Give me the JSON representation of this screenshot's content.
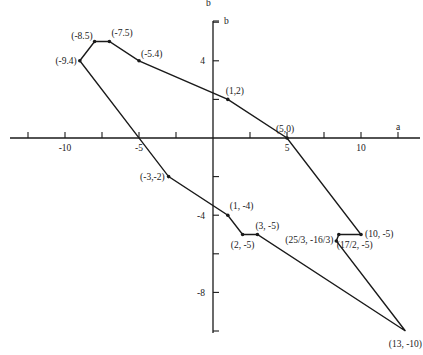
{
  "chart_data": {
    "type": "line",
    "title": "",
    "caption_fragment": "b",
    "xlabel": "a",
    "ylabel": "b",
    "x_ticks": [
      -10,
      -5,
      5,
      10
    ],
    "y_ticks": [
      4,
      -4,
      -8
    ],
    "xlim": [
      -13,
      13.5
    ],
    "ylim": [
      -10,
      6
    ],
    "grid": false,
    "legend": null,
    "series": [
      {
        "name": "polygon",
        "closed": true,
        "points": [
          {
            "x": -9,
            "y": 4,
            "label": "(-9.4)"
          },
          {
            "x": -8,
            "y": 5,
            "label": "(-8.5)"
          },
          {
            "x": -7,
            "y": 5,
            "label": "(-7.5)"
          },
          {
            "x": -5,
            "y": 4,
            "label": "(-5.4)"
          },
          {
            "x": 1,
            "y": 2,
            "label": "(1,2)"
          },
          {
            "x": 5,
            "y": 0,
            "label": "(5,0)"
          },
          {
            "x": 10,
            "y": -5,
            "label": "(10, -5)"
          },
          {
            "x": 8.5,
            "y": -5,
            "label": "(17/2, -5)"
          },
          {
            "x": 8.333,
            "y": -5.333,
            "label": "(25/3, -16/3)"
          },
          {
            "x": 13,
            "y": -10,
            "label": "(13, -10)"
          },
          {
            "x": 3,
            "y": -5,
            "label": "(3, -5)"
          },
          {
            "x": 2,
            "y": -5,
            "label": "(2, -5)"
          },
          {
            "x": 1,
            "y": -4,
            "label": "(1, -4)"
          },
          {
            "x": -3,
            "y": -2,
            "label": "(-3,-2)"
          }
        ]
      }
    ]
  }
}
